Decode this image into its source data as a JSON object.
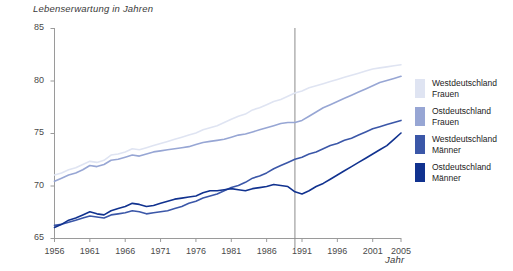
{
  "chart_data": {
    "type": "line",
    "title": "",
    "ylabel": "Lebenserwartung in Jahren",
    "xlabel": "Jahr",
    "ylim": [
      65,
      85
    ],
    "yticks": [
      65,
      70,
      75,
      80,
      85
    ],
    "xlim": [
      1956,
      2005
    ],
    "xticks": [
      1956,
      1961,
      1966,
      1971,
      1976,
      1981,
      1986,
      1991,
      1996,
      2001,
      2005
    ],
    "grid": false,
    "legend_position": "right",
    "annotations": [
      {
        "type": "vline",
        "x": 1990,
        "label": ""
      }
    ],
    "x": [
      1956,
      1957,
      1958,
      1959,
      1960,
      1961,
      1962,
      1963,
      1964,
      1965,
      1966,
      1967,
      1968,
      1969,
      1970,
      1971,
      1972,
      1973,
      1974,
      1975,
      1976,
      1977,
      1978,
      1979,
      1980,
      1981,
      1982,
      1983,
      1984,
      1985,
      1986,
      1987,
      1988,
      1989,
      1990,
      1991,
      1992,
      1993,
      1994,
      1995,
      1996,
      1997,
      1998,
      1999,
      2000,
      2001,
      2002,
      2003,
      2004,
      2005
    ],
    "series": [
      {
        "name": "Westdeutschland Frauen",
        "color": "#dfe4f2",
        "values": [
          71.0,
          71.2,
          71.5,
          71.7,
          72.0,
          72.3,
          72.2,
          72.4,
          72.9,
          73.0,
          73.2,
          73.5,
          73.4,
          73.6,
          73.8,
          74.0,
          74.2,
          74.4,
          74.6,
          74.8,
          75.0,
          75.3,
          75.5,
          75.7,
          76.0,
          76.3,
          76.6,
          76.8,
          77.2,
          77.4,
          77.7,
          78.0,
          78.2,
          78.5,
          78.8,
          79.0,
          79.3,
          79.5,
          79.7,
          79.9,
          80.1,
          80.3,
          80.5,
          80.7,
          80.9,
          81.1,
          81.2,
          81.3,
          81.4,
          81.5
        ]
      },
      {
        "name": "Ostdeutschland Frauen",
        "color": "#97a6d4",
        "values": [
          70.4,
          70.7,
          71.0,
          71.2,
          71.5,
          71.9,
          71.8,
          72.0,
          72.4,
          72.5,
          72.7,
          72.9,
          72.8,
          73.0,
          73.2,
          73.3,
          73.4,
          73.5,
          73.6,
          73.7,
          73.9,
          74.1,
          74.2,
          74.3,
          74.4,
          74.6,
          74.8,
          74.9,
          75.1,
          75.3,
          75.5,
          75.7,
          75.9,
          76.0,
          76.0,
          76.2,
          76.6,
          77.0,
          77.4,
          77.7,
          78.0,
          78.3,
          78.6,
          78.9,
          79.2,
          79.5,
          79.8,
          80.0,
          80.2,
          80.4
        ]
      },
      {
        "name": "Westdeutschland Männer",
        "color": "#3b57a8"
      },
      {
        "name": "Ostdeutschland Männer",
        "color": "#11328f"
      }
    ],
    "series_values_men": {
      "west": [
        66.2,
        66.3,
        66.5,
        66.7,
        66.9,
        67.1,
        67.0,
        66.9,
        67.2,
        67.3,
        67.4,
        67.6,
        67.5,
        67.3,
        67.4,
        67.5,
        67.6,
        67.8,
        68.0,
        68.3,
        68.5,
        68.8,
        69.0,
        69.2,
        69.5,
        69.8,
        70.0,
        70.3,
        70.7,
        70.9,
        71.2,
        71.6,
        71.9,
        72.2,
        72.5,
        72.7,
        73.0,
        73.2,
        73.5,
        73.8,
        74.0,
        74.3,
        74.5,
        74.8,
        75.1,
        75.4,
        75.6,
        75.8,
        76.0,
        76.2
      ],
      "east": [
        66.0,
        66.3,
        66.7,
        66.9,
        67.2,
        67.5,
        67.3,
        67.2,
        67.6,
        67.8,
        68.0,
        68.3,
        68.2,
        68.0,
        68.1,
        68.3,
        68.5,
        68.7,
        68.8,
        68.9,
        69.0,
        69.3,
        69.5,
        69.5,
        69.6,
        69.7,
        69.6,
        69.5,
        69.7,
        69.8,
        69.9,
        70.1,
        70.0,
        69.9,
        69.4,
        69.2,
        69.5,
        69.9,
        70.2,
        70.6,
        71.0,
        71.4,
        71.8,
        72.2,
        72.6,
        73.0,
        73.4,
        73.8,
        74.4,
        75.0
      ]
    }
  },
  "legend": {
    "items": [
      {
        "label": "Westdeutschland\nFrauen",
        "color": "#dfe4f2"
      },
      {
        "label": "Ostdeutschland\nFrauen",
        "color": "#97a6d4"
      },
      {
        "label": "Westdeutschland\nMänner",
        "color": "#3b57a8"
      },
      {
        "label": "Ostdeutschland\nMänner",
        "color": "#11328f"
      }
    ]
  }
}
